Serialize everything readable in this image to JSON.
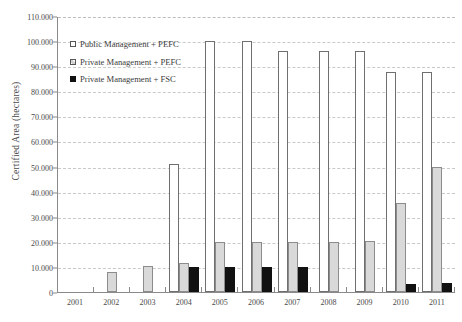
{
  "chart_data": {
    "type": "bar",
    "title": "",
    "xlabel": "",
    "ylabel": "Certified Area (hectares)",
    "categories": [
      "2001",
      "2002",
      "2003",
      "2004",
      "2005",
      "2006",
      "2007",
      "2008",
      "2009",
      "2010",
      "2011"
    ],
    "ylim": [
      0,
      110000
    ],
    "ytick_step": 10000,
    "ytick_labels": [
      "110.000",
      "100.000",
      "90.000",
      "80.000",
      "70.000",
      "60.000",
      "50.000",
      "40.000",
      "30.000",
      "20.000",
      "10.000",
      "0"
    ],
    "ytick_values": [
      110000,
      100000,
      90000,
      80000,
      70000,
      60000,
      50000,
      40000,
      30000,
      20000,
      10000,
      0
    ],
    "grid": true,
    "legend_position": "upper-left-inside",
    "series": [
      {
        "name": "Public Management + PEFC",
        "color": "#ffffff",
        "edge_color": "#6f6f6f",
        "values": [
          0,
          0,
          0,
          51000,
          100000,
          100000,
          96000,
          96000,
          96000,
          87500,
          87500
        ]
      },
      {
        "name": "Private Management + PEFC",
        "color": "#d9d9d9",
        "edge_color": "#8c8c8c",
        "values": [
          0,
          8000,
          10500,
          11500,
          20000,
          20000,
          20000,
          20000,
          20500,
          35500,
          50000
        ]
      },
      {
        "name": "Private Management + FSC",
        "color": "#111111",
        "edge_color": "#111111",
        "values": [
          0,
          0,
          0,
          10000,
          10000,
          10000,
          10000,
          0,
          0,
          3000,
          3500
        ]
      }
    ]
  },
  "legend": {
    "items": [
      {
        "label": "Public Management + PEFC",
        "style": "pub"
      },
      {
        "label": "Private Management + PEFC",
        "style": "priv-pefc"
      },
      {
        "label": "Private Management + FSC",
        "style": "priv-fsc"
      }
    ]
  }
}
